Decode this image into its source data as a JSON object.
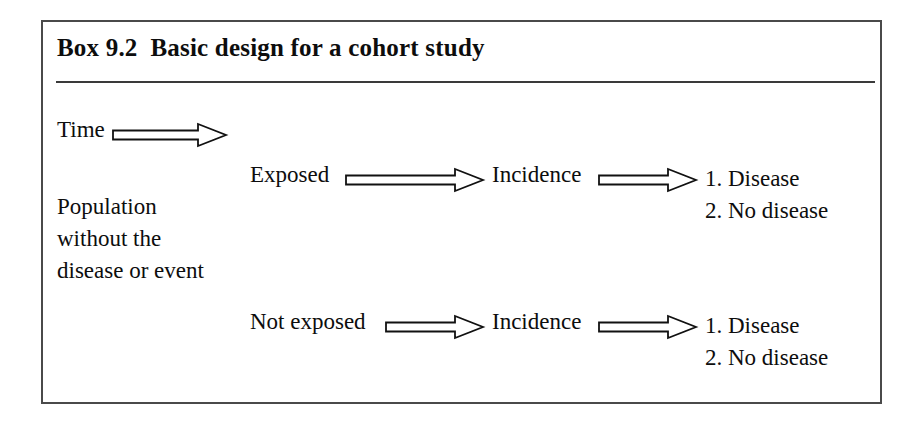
{
  "figure": {
    "box_label": "Box 9.2",
    "title": "Box 9.2  Basic design for a cohort study",
    "border_color": "#4a4a4a",
    "rule_color": "#3a3a3a",
    "text_color": "#0d0d0d",
    "background_color": "#ffffff"
  },
  "diagram": {
    "time_axis": {
      "label": "Time",
      "arrow_icon": "double-line-right-arrow"
    },
    "source_population": {
      "lines": [
        "Population",
        "without the",
        "disease or event"
      ]
    },
    "branches": [
      {
        "exposure_label": "Exposed",
        "arrow_icon": "double-line-right-arrow",
        "measure_label": "Incidence",
        "outcome_arrow_icon": "double-line-right-arrow",
        "outcomes": [
          "1. Disease",
          "2. No disease"
        ]
      },
      {
        "exposure_label": "Not exposed",
        "arrow_icon": "double-line-right-arrow",
        "measure_label": "Incidence",
        "outcome_arrow_icon": "double-line-right-arrow",
        "outcomes": [
          "1. Disease",
          "2. No disease"
        ]
      }
    ]
  }
}
